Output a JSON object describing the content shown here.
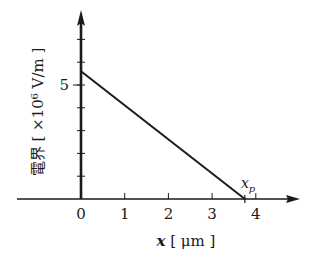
{
  "chart_data": {
    "type": "line",
    "title": "",
    "xlabel_var": "x",
    "xlabel_unit": " [ μm ]",
    "ylabel": "電界 [ ×10⁶ V/m ]",
    "x": [
      0,
      3.75
    ],
    "series": [
      {
        "name": "電界",
        "values": [
          5.6,
          0
        ]
      }
    ],
    "xlim": [
      -1.5,
      5
    ],
    "ylim": [
      0,
      8.5
    ],
    "x_ticks": [
      0,
      1,
      2,
      3,
      4
    ],
    "x_tick_labels": [
      "0",
      "1",
      "2",
      "3",
      "4"
    ],
    "y_ticks": [
      1,
      2,
      3,
      4,
      5,
      6,
      7
    ],
    "y_tick_labels": [
      "",
      "",
      "",
      "",
      "5",
      "",
      ""
    ],
    "annotations": [
      {
        "text": "x",
        "subscript": "p",
        "x": 3.75,
        "y": 0
      }
    ],
    "grid": false,
    "legend": false,
    "colors": {
      "line": "#1a1a1a",
      "axis": "#1a1a1a"
    }
  }
}
